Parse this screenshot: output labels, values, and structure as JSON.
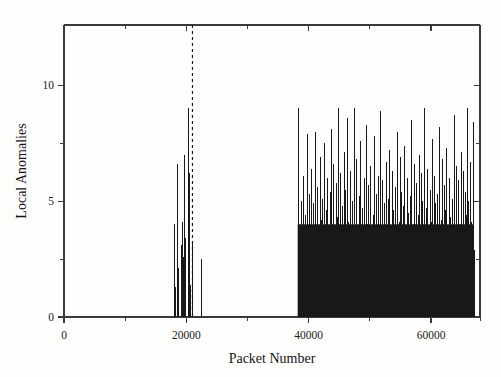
{
  "figure": {
    "background_color": "#fdfdfc",
    "foreground_color": "#1b1b1b"
  },
  "chart_data": {
    "type": "bar",
    "title": "",
    "subtitle": "",
    "xlabel": "Packet Number",
    "ylabel": "Local Anomalies",
    "xlim": [
      0,
      68000
    ],
    "ylim": [
      0,
      12.6
    ],
    "grid": false,
    "legend": null,
    "x_ticks_major": [
      0,
      20000,
      40000,
      60000
    ],
    "x_tick_labels": [
      "0",
      "20000",
      "40000",
      "60000"
    ],
    "x_ticks_minor": [
      10000,
      30000,
      50000,
      68000
    ],
    "y_ticks_major": [
      0,
      5,
      10
    ],
    "y_tick_labels": [
      "0",
      "5",
      "10"
    ],
    "y_ticks_minor": [
      2.5,
      7.5
    ],
    "bar_color": "#181818",
    "annotations": [
      {
        "name": "detection-threshold-line",
        "type": "vertical-dashed-line",
        "x": 21000,
        "color": "#1a1a1a",
        "label": ""
      }
    ],
    "series": [
      {
        "name": "Local Anomalies",
        "color": "#181818",
        "points": [
          [
            18050,
            4.0
          ],
          [
            18130,
            1.3
          ],
          [
            18480,
            6.6
          ],
          [
            18560,
            2.1
          ],
          [
            19140,
            3.1
          ],
          [
            19230,
            4.1
          ],
          [
            19310,
            1.6
          ],
          [
            19500,
            2.6
          ],
          [
            19620,
            7.0
          ],
          [
            19700,
            3.4
          ],
          [
            19790,
            1.8
          ],
          [
            20300,
            9.0
          ],
          [
            20380,
            6.2
          ],
          [
            20460,
            2.9
          ],
          [
            20540,
            1.4
          ],
          [
            20900,
            3.3
          ],
          [
            21000,
            2.0
          ],
          [
            22350,
            2.5
          ],
          [
            22430,
            1.1
          ],
          [
            38200,
            9.0
          ],
          [
            38300,
            4.1
          ],
          [
            38400,
            2.6
          ],
          [
            38500,
            1.5
          ],
          [
            38650,
            3.0
          ],
          [
            38800,
            5.0
          ],
          [
            38950,
            2.2
          ],
          [
            39100,
            6.1
          ],
          [
            39250,
            1.9
          ],
          [
            39400,
            4.4
          ],
          [
            39550,
            3.2
          ],
          [
            39700,
            7.9
          ],
          [
            39850,
            2.4
          ],
          [
            40000,
            5.3
          ],
          [
            40150,
            3.8
          ],
          [
            40300,
            1.7
          ],
          [
            40450,
            6.4
          ],
          [
            40600,
            2.9
          ],
          [
            40750,
            4.9
          ],
          [
            40900,
            3.5
          ],
          [
            41050,
            8.0
          ],
          [
            41200,
            2.1
          ],
          [
            41350,
            5.6
          ],
          [
            41500,
            3.9
          ],
          [
            41650,
            1.4
          ],
          [
            41800,
            6.9
          ],
          [
            41950,
            4.2
          ],
          [
            42100,
            2.7
          ],
          [
            42250,
            5.1
          ],
          [
            42400,
            3.3
          ],
          [
            42550,
            7.5
          ],
          [
            42700,
            2.2
          ],
          [
            42850,
            4.6
          ],
          [
            43000,
            6.0
          ],
          [
            43150,
            3.1
          ],
          [
            43300,
            1.9
          ],
          [
            43450,
            5.4
          ],
          [
            43600,
            8.1
          ],
          [
            43750,
            2.8
          ],
          [
            43900,
            4.0
          ],
          [
            44050,
            6.6
          ],
          [
            44200,
            3.6
          ],
          [
            44350,
            2.3
          ],
          [
            44500,
            5.8
          ],
          [
            44650,
            4.3
          ],
          [
            44800,
            9.0
          ],
          [
            44950,
            2.5
          ],
          [
            45100,
            6.2
          ],
          [
            45250,
            3.4
          ],
          [
            45400,
            4.8
          ],
          [
            45550,
            1.8
          ],
          [
            45700,
            7.1
          ],
          [
            45850,
            3.0
          ],
          [
            46000,
            5.5
          ],
          [
            46150,
            2.6
          ],
          [
            46300,
            8.6
          ],
          [
            46450,
            4.1
          ],
          [
            46600,
            3.2
          ],
          [
            46750,
            6.3
          ],
          [
            46900,
            2.0
          ],
          [
            47050,
            5.0
          ],
          [
            47200,
            3.7
          ],
          [
            47350,
            9.0
          ],
          [
            47500,
            2.4
          ],
          [
            47650,
            4.5
          ],
          [
            47800,
            6.8
          ],
          [
            47950,
            3.1
          ],
          [
            48100,
            1.6
          ],
          [
            48250,
            5.2
          ],
          [
            48400,
            7.6
          ],
          [
            48550,
            2.9
          ],
          [
            48700,
            4.7
          ],
          [
            48850,
            3.5
          ],
          [
            49000,
            6.0
          ],
          [
            49150,
            2.2
          ],
          [
            49300,
            8.3
          ],
          [
            49450,
            4.0
          ],
          [
            49600,
            3.3
          ],
          [
            49750,
            5.7
          ],
          [
            49900,
            2.7
          ],
          [
            50050,
            6.5
          ],
          [
            50200,
            3.9
          ],
          [
            50350,
            1.9
          ],
          [
            50500,
            4.4
          ],
          [
            50650,
            7.8
          ],
          [
            50800,
            2.5
          ],
          [
            50950,
            5.3
          ],
          [
            51100,
            3.0
          ],
          [
            51250,
            6.1
          ],
          [
            51400,
            4.2
          ],
          [
            51550,
            2.1
          ],
          [
            51700,
            8.9
          ],
          [
            51850,
            3.6
          ],
          [
            52000,
            5.9
          ],
          [
            52150,
            2.8
          ],
          [
            52300,
            4.9
          ],
          [
            52450,
            3.2
          ],
          [
            52600,
            6.7
          ],
          [
            52750,
            1.7
          ],
          [
            52900,
            5.1
          ],
          [
            53050,
            4.3
          ],
          [
            53200,
            7.2
          ],
          [
            53350,
            2.3
          ],
          [
            53500,
            3.8
          ],
          [
            53650,
            6.3
          ],
          [
            53800,
            4.6
          ],
          [
            53950,
            2.9
          ],
          [
            54100,
            5.6
          ],
          [
            54250,
            3.4
          ],
          [
            54400,
            8.0
          ],
          [
            54550,
            2.0
          ],
          [
            54700,
            4.1
          ],
          [
            54850,
            6.9
          ],
          [
            55000,
            3.1
          ],
          [
            55150,
            5.4
          ],
          [
            55300,
            2.6
          ],
          [
            55450,
            4.8
          ],
          [
            55600,
            7.4
          ],
          [
            55750,
            3.7
          ],
          [
            55900,
            1.5
          ],
          [
            56050,
            6.0
          ],
          [
            56200,
            4.5
          ],
          [
            56350,
            2.4
          ],
          [
            56500,
            5.2
          ],
          [
            56650,
            3.3
          ],
          [
            56800,
            8.5
          ],
          [
            56950,
            2.7
          ],
          [
            57100,
            4.0
          ],
          [
            57250,
            6.6
          ],
          [
            57400,
            3.5
          ],
          [
            57550,
            5.8
          ],
          [
            57700,
            2.1
          ],
          [
            57850,
            4.4
          ],
          [
            58000,
            7.0
          ],
          [
            58150,
            3.0
          ],
          [
            58300,
            6.2
          ],
          [
            58450,
            2.8
          ],
          [
            58600,
            5.0
          ],
          [
            58750,
            3.9
          ],
          [
            58900,
            9.0
          ],
          [
            59050,
            2.2
          ],
          [
            59200,
            4.7
          ],
          [
            59350,
            6.4
          ],
          [
            59500,
            3.2
          ],
          [
            59650,
            1.8
          ],
          [
            59800,
            5.5
          ],
          [
            59950,
            4.1
          ],
          [
            60100,
            7.7
          ],
          [
            60250,
            2.5
          ],
          [
            60400,
            3.6
          ],
          [
            60550,
            6.1
          ],
          [
            60700,
            4.9
          ],
          [
            60850,
            2.3
          ],
          [
            61000,
            5.3
          ],
          [
            61150,
            3.4
          ],
          [
            61300,
            8.2
          ],
          [
            61450,
            2.9
          ],
          [
            61600,
            4.2
          ],
          [
            61750,
            6.8
          ],
          [
            61900,
            3.1
          ],
          [
            62050,
            5.7
          ],
          [
            62200,
            2.6
          ],
          [
            62350,
            4.6
          ],
          [
            62500,
            7.3
          ],
          [
            62650,
            3.8
          ],
          [
            62800,
            1.6
          ],
          [
            62950,
            6.0
          ],
          [
            63100,
            4.3
          ],
          [
            63250,
            2.7
          ],
          [
            63400,
            5.1
          ],
          [
            63550,
            3.3
          ],
          [
            63700,
            8.7
          ],
          [
            63850,
            2.4
          ],
          [
            64000,
            4.8
          ],
          [
            64150,
            6.5
          ],
          [
            64300,
            3.7
          ],
          [
            64450,
            5.9
          ],
          [
            64600,
            2.0
          ],
          [
            64750,
            4.0
          ],
          [
            64900,
            7.1
          ],
          [
            65050,
            3.5
          ],
          [
            65200,
            6.3
          ],
          [
            65350,
            2.8
          ],
          [
            65500,
            5.4
          ],
          [
            65650,
            4.4
          ],
          [
            65800,
            9.0
          ],
          [
            65950,
            3.0
          ],
          [
            66100,
            5.0
          ],
          [
            66250,
            2.5
          ],
          [
            66400,
            6.7
          ],
          [
            66550,
            4.1
          ],
          [
            66700,
            3.2
          ],
          [
            66850,
            8.4
          ],
          [
            67000,
            2.9
          ]
        ],
        "dense_fill": {
          "x_start": 38200,
          "x_end": 67000,
          "level": 4.0
        }
      }
    ]
  }
}
